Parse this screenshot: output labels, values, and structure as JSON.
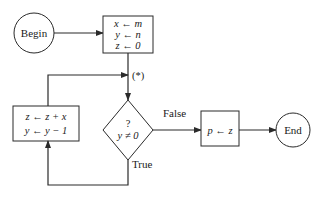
{
  "diagram": {
    "type": "flowchart",
    "colors": {
      "stroke": "#2a2a2a",
      "text": "#1a1a1a",
      "background": "#ffffff"
    },
    "nodes": {
      "begin": {
        "shape": "circle",
        "label": "Begin"
      },
      "init": {
        "shape": "rect",
        "lines": [
          "x ← m",
          "y ← n",
          "z ← 0"
        ]
      },
      "test": {
        "shape": "diamond",
        "lines": [
          "?",
          "y ≠ 0"
        ]
      },
      "loop_body": {
        "shape": "rect",
        "lines": [
          "z ← z + x",
          "y ← y − 1"
        ]
      },
      "assign": {
        "shape": "rect",
        "label": "p ← z"
      },
      "end": {
        "shape": "circle",
        "label": "End"
      }
    },
    "edges": {
      "begin_to_init": {
        "from": "begin",
        "to": "init",
        "label": ""
      },
      "init_to_test": {
        "from": "init",
        "to": "test",
        "label": "(*)"
      },
      "test_false": {
        "from": "test",
        "to": "assign",
        "label": "False"
      },
      "test_true": {
        "from": "test",
        "to": "loop_body",
        "label": "True"
      },
      "loop_back": {
        "from": "loop_body",
        "to": "test",
        "label": ""
      },
      "assign_to_end": {
        "from": "assign",
        "to": "end",
        "label": ""
      }
    }
  }
}
